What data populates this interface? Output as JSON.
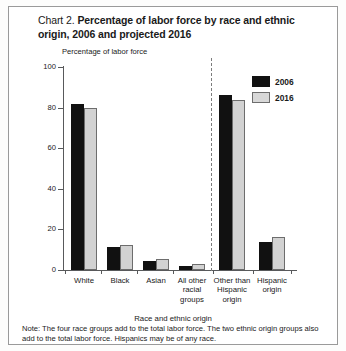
{
  "chart_data": {
    "type": "bar",
    "title": "Chart 2. Percentage of labor force by race and ethnic origin, 2006 and projected 2016",
    "title_prefix": "Chart 2. ",
    "title_main": "Percentage of labor force by race and ethnic origin, 2006 and projected 2016",
    "xlabel": "Race and ethnic origin",
    "ylabel": "Percentage of labor force",
    "ylim": [
      0,
      100
    ],
    "yticks": [
      0,
      20,
      40,
      60,
      80,
      100
    ],
    "ytick_labels": [
      "0",
      "20",
      "40",
      "60",
      "80",
      "100"
    ],
    "grid": false,
    "legend_position": "top-right",
    "categories": [
      "White",
      "Black",
      "Asian",
      "All other racial groups",
      "Other than Hispanic origin",
      "Hispanic origin"
    ],
    "category_lines": [
      [
        "White"
      ],
      [
        "Black"
      ],
      [
        "Asian"
      ],
      [
        "All other",
        "racial",
        "groups"
      ],
      [
        "Other than",
        "Hispanic",
        "origin"
      ],
      [
        "Hispanic",
        "origin"
      ]
    ],
    "series": [
      {
        "name": "2006",
        "color": "#111111",
        "values": [
          82.0,
          11.4,
          4.4,
          2.2,
          86.3,
          13.7
        ]
      },
      {
        "name": "2016",
        "color": "#d2d2d2",
        "values": [
          79.6,
          12.3,
          5.3,
          2.8,
          83.9,
          16.4
        ]
      }
    ],
    "divider_after_category_index": 3,
    "note_label": "Note:",
    "note": "Note:  The four race groups add to the total labor force. The two ethnic origin groups also add to the total labor force. Hispanics may be of any race.",
    "note_body": "The four race groups add to the total labor force. The two ethnic origin groups also add to the total labor force. Hispanics may be of any race."
  },
  "legend": {
    "items": [
      {
        "label": "2006",
        "swatch": "black-filled-swatch"
      },
      {
        "label": "2016",
        "swatch": "gray-filled-swatch"
      }
    ]
  }
}
